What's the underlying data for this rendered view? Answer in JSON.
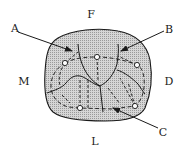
{
  "diagram": {
    "type": "tooth-occlusal-view",
    "colors": {
      "fill": "#c9c9c9",
      "stroke": "#1a1a1a",
      "background": "#ffffff"
    },
    "surface_labels": {
      "facial": "F",
      "mesial": "M",
      "distal": "D",
      "lingual": "L"
    },
    "pointer_labels": {
      "a": "A",
      "b": "B",
      "c": "C"
    },
    "cusp_tips": [
      {
        "x": 97,
        "y": 57
      },
      {
        "x": 65,
        "y": 63
      },
      {
        "x": 137,
        "y": 65
      },
      {
        "x": 80,
        "y": 108
      },
      {
        "x": 135,
        "y": 106
      }
    ]
  }
}
